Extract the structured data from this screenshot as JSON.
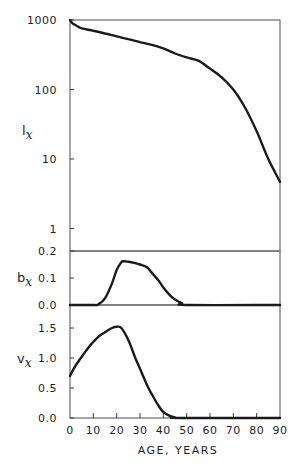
{
  "chart_data": [
    {
      "type": "line",
      "panel": "top",
      "ylabel": "l",
      "ylabel_subscript": "x",
      "xlabel": "AGE, YEARS",
      "yscale": "log",
      "ylim": [
        0.5,
        1000
      ],
      "yticks": [
        1000,
        100,
        10,
        1
      ],
      "ytick_labels": [
        "1000",
        "100",
        "10",
        "1"
      ],
      "x": [
        0,
        1,
        3,
        5,
        10,
        15,
        20,
        25,
        30,
        35,
        40,
        45,
        50,
        55,
        60,
        65,
        70,
        75,
        80,
        85,
        90
      ],
      "values": [
        1000,
        900,
        820,
        760,
        700,
        640,
        580,
        530,
        480,
        440,
        390,
        330,
        290,
        260,
        200,
        150,
        100,
        55,
        25,
        10,
        4.7
      ]
    },
    {
      "type": "line",
      "panel": "middle",
      "ylabel": "b",
      "ylabel_subscript": "x",
      "ylim": [
        0.0,
        0.2
      ],
      "yticks": [
        0.2,
        0.1,
        0.0
      ],
      "ytick_labels": [
        "0.2",
        "0.1",
        "0.0"
      ],
      "x": [
        0,
        10,
        12,
        15,
        18,
        20,
        22,
        23,
        25,
        28,
        30,
        33,
        35,
        38,
        40,
        43,
        45,
        48,
        50,
        90
      ],
      "values": [
        0,
        0,
        0.002,
        0.025,
        0.08,
        0.13,
        0.158,
        0.162,
        0.16,
        0.155,
        0.15,
        0.14,
        0.12,
        0.09,
        0.065,
        0.035,
        0.02,
        0.006,
        0.0,
        0.0
      ]
    },
    {
      "type": "line",
      "panel": "bottom",
      "ylabel": "v",
      "ylabel_subscript": "x",
      "ylim": [
        0.0,
        1.8
      ],
      "yticks": [
        1.5,
        1.0,
        0.5,
        0.0
      ],
      "ytick_labels": [
        "1.5",
        "1.0",
        "0.5",
        "0.0"
      ],
      "x": [
        0,
        2,
        5,
        8,
        10,
        13,
        15,
        18,
        20,
        22,
        25,
        28,
        30,
        33,
        35,
        38,
        40,
        43,
        45,
        47,
        90
      ],
      "values": [
        0.7,
        0.85,
        1.02,
        1.18,
        1.27,
        1.38,
        1.43,
        1.5,
        1.52,
        1.5,
        1.3,
        1.0,
        0.82,
        0.55,
        0.4,
        0.2,
        0.1,
        0.03,
        0.01,
        0.0,
        0.0
      ]
    }
  ],
  "axes": {
    "xticks": [
      0,
      10,
      20,
      30,
      40,
      50,
      60,
      70,
      80,
      90
    ],
    "xtick_labels": [
      "0",
      "10",
      "20",
      "30",
      "40",
      "50",
      "60",
      "70",
      "80",
      "90"
    ],
    "xlim": [
      0,
      90
    ],
    "xlabel": "AGE, YEARS"
  },
  "labels": {
    "lx_main": "l",
    "lx_sub": "x",
    "bx_main": "b",
    "bx_sub": "x",
    "vx_main": "v",
    "vx_sub": "x",
    "xlabel": "AGE, YEARS"
  },
  "colors": {
    "curve": "#1a1a1a",
    "frame": "#6a6a6a",
    "background": "#ffffff"
  }
}
